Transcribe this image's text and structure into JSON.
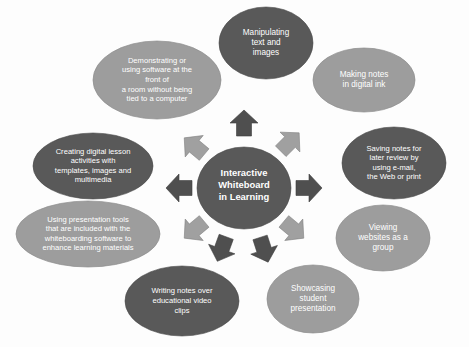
{
  "diagram": {
    "type": "radial-hub-and-spoke",
    "background_color": "#fdfdfd",
    "hub": {
      "name": "interactive-whiteboard-hub",
      "lines": [
        "Interactive",
        "Whiteboard",
        "in Learning"
      ],
      "fill": "#595959",
      "text_color": "#ffffff",
      "cx": 244,
      "cy": 188,
      "rx": 47,
      "ry": 41
    },
    "palette": {
      "dark": "#595959",
      "light": "#9d9d9d",
      "arrow_dark": "#4f4f4f",
      "arrow_light": "#a0a0a0",
      "text": "#ffffff",
      "background": "#fdfdfd"
    },
    "nodes": [
      {
        "id": "manipulating-text-and-images",
        "lines": [
          "Manipulating",
          "text and",
          "images"
        ],
        "fill": "dark",
        "cx": 266,
        "cy": 43,
        "rx": 47,
        "ry": 36,
        "font": "md"
      },
      {
        "id": "making-notes-in-digital-ink",
        "lines": [
          "Making notes",
          "in digital ink"
        ],
        "fill": "light",
        "cx": 364,
        "cy": 80,
        "rx": 51,
        "ry": 32,
        "font": "md"
      },
      {
        "id": "saving-notes-for-later-review",
        "lines": [
          "Saving notes for",
          "later review by",
          "using e-mail,",
          "the Web or print"
        ],
        "fill": "dark",
        "cx": 394,
        "cy": 163,
        "rx": 52,
        "ry": 36,
        "font": "sm"
      },
      {
        "id": "viewing-websites-as-a-group",
        "lines": [
          "Viewing",
          "websites as a",
          "group"
        ],
        "fill": "light",
        "cx": 383,
        "cy": 238,
        "rx": 47,
        "ry": 33,
        "font": "md"
      },
      {
        "id": "showcasing-student-presentation",
        "lines": [
          "Showcasing",
          "student",
          "presentation"
        ],
        "fill": "light",
        "cx": 313,
        "cy": 299,
        "rx": 46,
        "ry": 34,
        "font": "md"
      },
      {
        "id": "writing-notes-over-video-clips",
        "lines": [
          "Writing notes over",
          "educational video",
          "clips"
        ],
        "fill": "dark",
        "cx": 182,
        "cy": 301,
        "rx": 57,
        "ry": 35,
        "font": "sm"
      },
      {
        "id": "using-presentation-tools",
        "lines": [
          "Using presentation tools",
          "that are included with the",
          "whiteboarding software to",
          "enhance learning materials"
        ],
        "fill": "light",
        "cx": 88,
        "cy": 234,
        "rx": 72,
        "ry": 33,
        "font": "sm"
      },
      {
        "id": "creating-digital-lesson-activities",
        "lines": [
          "Creating digital lesson",
          "activities with",
          "templates, images and",
          "multimedia"
        ],
        "fill": "dark",
        "cx": 93,
        "cy": 166,
        "rx": 60,
        "ry": 33,
        "font": "sm"
      },
      {
        "id": "demonstrating-or-using-software",
        "lines": [
          "Demonstrating or",
          "using software at the",
          "front of",
          "a room without being",
          "tied to a computer"
        ],
        "fill": "light",
        "cx": 157,
        "cy": 80,
        "rx": 64,
        "ry": 39,
        "font": "sm"
      }
    ],
    "arrows": [
      {
        "id": "arrow-up",
        "angle": -90,
        "fill": "arrow_dark"
      },
      {
        "id": "arrow-up-right",
        "angle": -45,
        "fill": "arrow_light"
      },
      {
        "id": "arrow-right",
        "angle": 0,
        "fill": "arrow_dark"
      },
      {
        "id": "arrow-down-right",
        "angle": 40,
        "fill": "arrow_light"
      },
      {
        "id": "arrow-down-right-lower",
        "angle": 72,
        "fill": "arrow_dark"
      },
      {
        "id": "arrow-down-left-lower",
        "angle": 110,
        "fill": "arrow_dark"
      },
      {
        "id": "arrow-down-left",
        "angle": 140,
        "fill": "arrow_light"
      },
      {
        "id": "arrow-left",
        "angle": 180,
        "fill": "arrow_dark"
      },
      {
        "id": "arrow-up-left",
        "angle": -140,
        "fill": "arrow_light"
      }
    ]
  }
}
